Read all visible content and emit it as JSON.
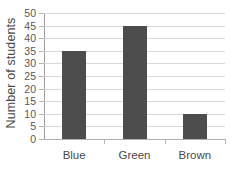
{
  "chart_data": {
    "type": "bar",
    "title": "",
    "xlabel": "",
    "ylabel": "Number of students",
    "categories": [
      "Blue",
      "Green",
      "Brown"
    ],
    "values": [
      35,
      45,
      10
    ],
    "ylim": [
      0,
      50
    ],
    "ytick_step": 5,
    "yticks": [
      0,
      5,
      10,
      15,
      20,
      25,
      30,
      35,
      40,
      45,
      50
    ],
    "ytick_labels": [
      "0",
      "5",
      "10",
      "15",
      "20",
      "25",
      "30",
      "35",
      "40",
      "45",
      "50"
    ],
    "grid": true,
    "grid_axis": "y",
    "legend": false,
    "bar_color": "#4d4d4d",
    "gridline_color": "#d9d9d9",
    "axis_color": "#9d9d9d",
    "text_color": "#4a4a4c",
    "background_color": "#ffffff"
  }
}
